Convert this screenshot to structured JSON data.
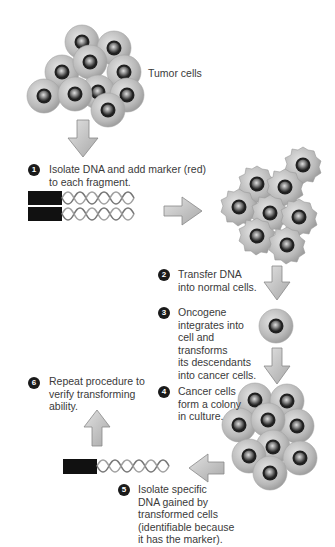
{
  "diagram": {
    "tumor_label": "Tumor cells",
    "steps": [
      {
        "number": "1",
        "text_lines": [
          "Isolate DNA and add marker (red)",
          "to each fragment."
        ]
      },
      {
        "number": "2",
        "text_lines": [
          "Transfer DNA",
          "into normal cells."
        ]
      },
      {
        "number": "3",
        "text_lines": [
          "Oncogene",
          "integrates into",
          "cell and",
          "transforms",
          "its descendants",
          "into cancer cells."
        ]
      },
      {
        "number": "4",
        "text_lines": [
          "Cancer cells",
          "form a colony",
          "in culture."
        ]
      },
      {
        "number": "5",
        "text_lines": [
          "Isolate specific",
          "DNA gained by",
          "transformed cells",
          "(identifiable because",
          "it has the marker)."
        ]
      },
      {
        "number": "6",
        "text_lines": [
          "Repeat procedure to",
          "verify transforming",
          "ability."
        ]
      }
    ],
    "colors": {
      "cell_outer": "#b8b8b8",
      "cell_nucleus": "#2a2a2a",
      "arrow_fill": "#c8c8c8",
      "marker": "#1a1a1a",
      "step_badge": "#1a1a1a"
    }
  }
}
